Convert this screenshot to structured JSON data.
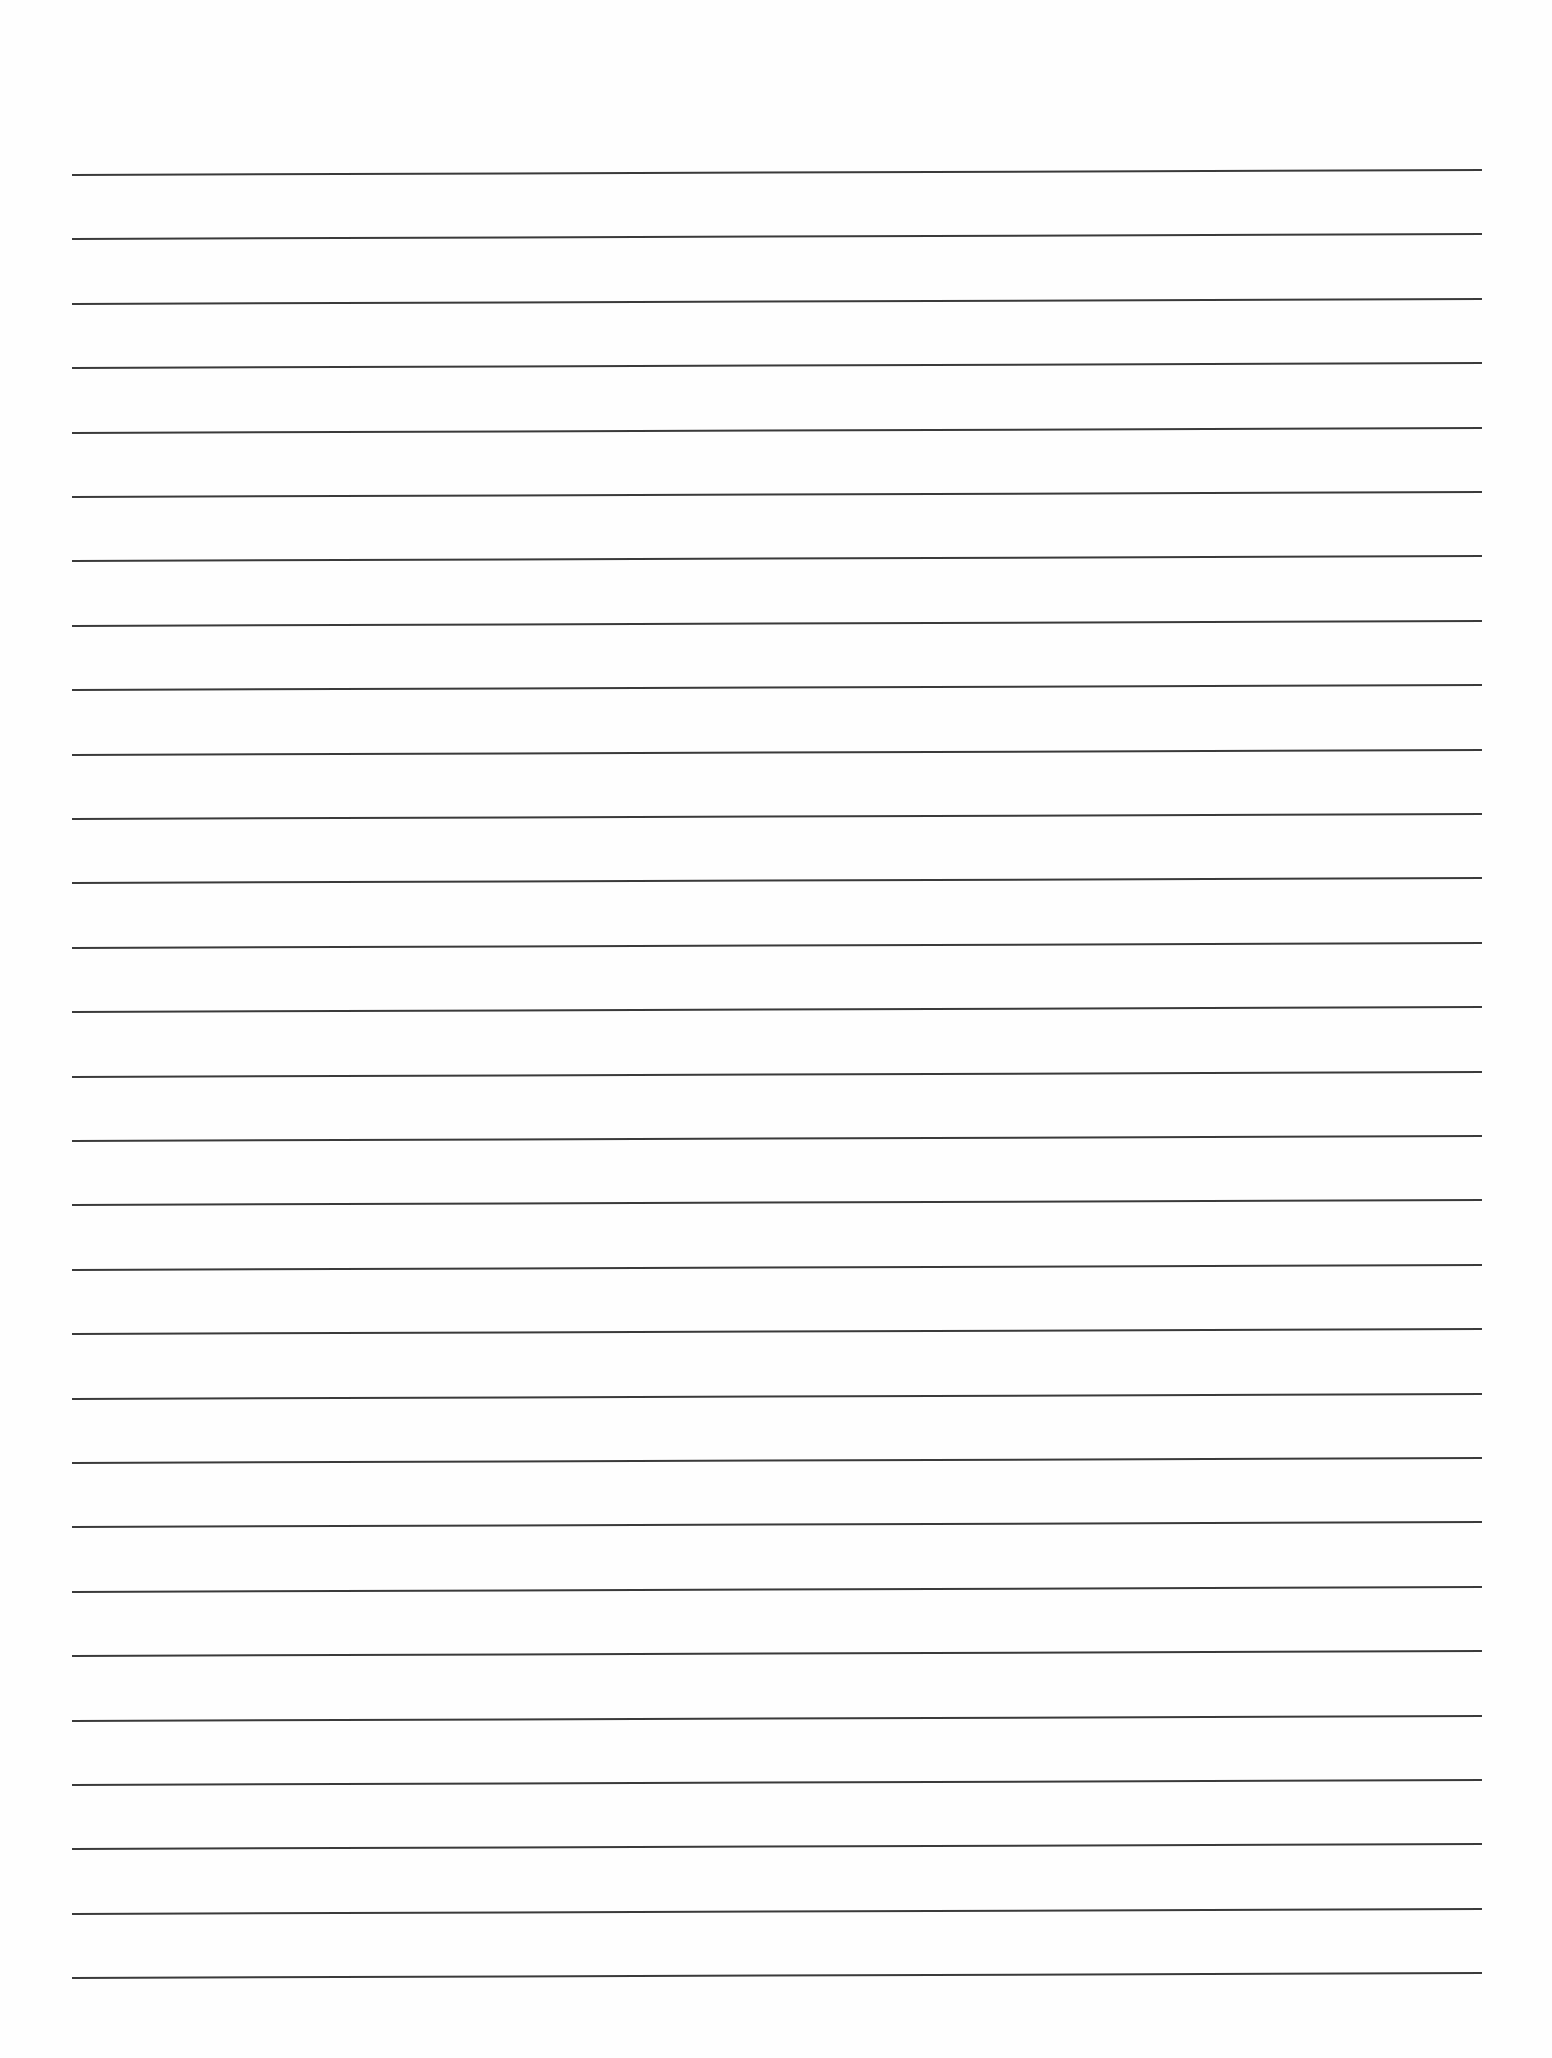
{
  "page": {
    "type": "lined-paper",
    "background_color": "#fefefe",
    "rule_color": "#3a3a3a",
    "rule_count": 29,
    "first_rule_y": 174,
    "rule_spacing": 64.4,
    "rule_left_x": 72,
    "rule_right_x": 1482,
    "rule_tilt_px": -5
  }
}
